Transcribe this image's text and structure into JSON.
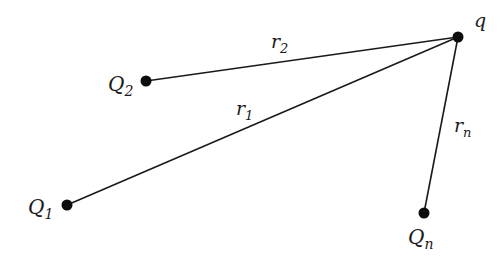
{
  "diagram": {
    "colors": {
      "line": "#1a1a1a",
      "dot": "#0d0d0d",
      "background": "#ffffff"
    },
    "points": {
      "q": {
        "label": "q",
        "sub": "",
        "x": 458,
        "y": 37
      },
      "Q2": {
        "label": "Q",
        "sub": "2",
        "x": 146,
        "y": 81
      },
      "Q1": {
        "label": "Q",
        "sub": "1",
        "x": 67,
        "y": 205
      },
      "Qn": {
        "label": "Q",
        "sub": "n",
        "x": 424,
        "y": 213
      }
    },
    "segments": [
      {
        "id": "r2",
        "label": "r",
        "sub": "2"
      },
      {
        "id": "r1",
        "label": "r",
        "sub": "1"
      },
      {
        "id": "rn",
        "label": "r",
        "sub": "n"
      }
    ]
  }
}
